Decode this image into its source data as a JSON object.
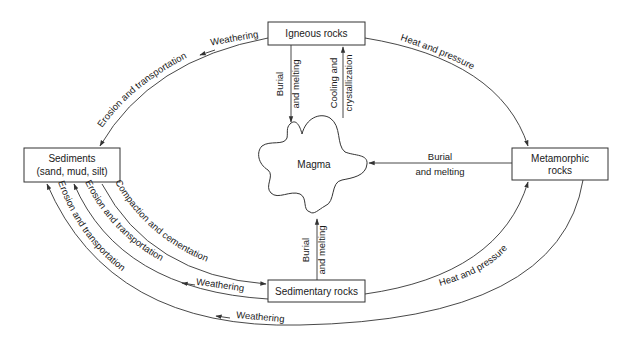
{
  "nodes": {
    "igneous": {
      "label": "Igneous rocks"
    },
    "sediments": {
      "label_line1": "Sediments",
      "label_line2": "(sand, mud, silt)"
    },
    "metamorphic": {
      "label_line1": "Metamorphic",
      "label_line2": "rocks"
    },
    "sedimentary": {
      "label": "Sedimentary rocks"
    },
    "magma": {
      "label": "Magma"
    }
  },
  "edges": {
    "igneous_to_sediments": {
      "label_a": "Weathering",
      "label_b": "Erosion and transportation"
    },
    "igneous_to_metamorphic": {
      "label": "Heat and pressure"
    },
    "igneous_to_magma": {
      "label_line1": "Burial",
      "label_line2": "and melting"
    },
    "magma_to_igneous": {
      "label_line1": "Cooling and",
      "label_line2": "crystallization"
    },
    "metamorphic_to_magma": {
      "label_line1": "Burial",
      "label_line2": "and melting"
    },
    "sedimentary_to_magma": {
      "label_line1": "Burial",
      "label_line2": "and melting"
    },
    "sediments_to_sedimentary": {
      "label": "Compaction and cementation"
    },
    "sedimentary_to_sediments": {
      "label_a": "Erosion and transportation",
      "label_b": "Weathering"
    },
    "sedimentary_to_metamorphic": {
      "label": "Heat and pressure"
    },
    "metamorphic_to_sediments": {
      "label_a": "Erosion and transportation",
      "label_b": "Weathering"
    }
  },
  "colors": {
    "stroke": "#333333",
    "text": "#1a1a1a",
    "background": "#ffffff"
  }
}
